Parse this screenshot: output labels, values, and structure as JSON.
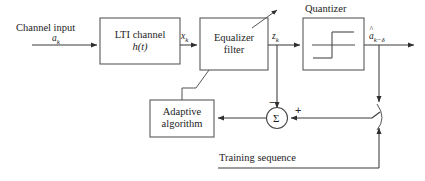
{
  "diagram": {
    "background_color": "#ffffff",
    "line_color": "#3a3a3a",
    "box_stroke_color": "#5a5a5a",
    "blocks": [
      {
        "id": "lti_channel",
        "line1": "LTI channel",
        "line2": "h(t)"
      },
      {
        "id": "equalizer_filter",
        "line1": "Equalizer",
        "line2": "filter"
      },
      {
        "id": "quantizer",
        "label": "Quantizer"
      },
      {
        "id": "adaptive_algorithm",
        "line1": "Adaptive",
        "line2": "algorithm"
      }
    ],
    "signals": {
      "channel_input_label": "Channel input",
      "channel_input_symbol": "a",
      "channel_input_subscript": "k",
      "channel_output_symbol": "x",
      "channel_output_subscript": "k",
      "equalizer_output_symbol": "z",
      "equalizer_output_subscript": "k",
      "decision_symbol": "a",
      "decision_hat": "^",
      "decision_subscript": "k−δ",
      "training_sequence_label": "Training sequence"
    },
    "summing_junction": {
      "glyph": "Σ",
      "minus_sign": "−",
      "plus_sign": "+"
    }
  }
}
